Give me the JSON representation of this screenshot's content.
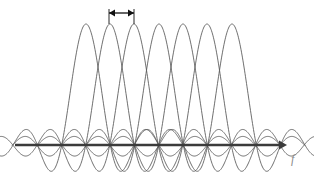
{
  "figure": {
    "title": "",
    "axis_label_f": "f",
    "axis_label_x": 291,
    "axis_label_y": 152,
    "axis_label_size": 12,
    "background": "#ffffff",
    "curve_color": "#555555",
    "axis_color": "#3b3b3b",
    "annotation_color": "#111111"
  },
  "chart_data": {
    "type": "line",
    "xlabel": "f",
    "ylabel": "",
    "grid": false,
    "legend": null,
    "axis": {
      "baseline_y_px": 145,
      "x_start_px": 15,
      "x_end_px": 286,
      "arrowhead": "right",
      "line_width_px": 2.4
    },
    "subcarriers": {
      "count": 7,
      "peak_positions_px": [
        86,
        110,
        134,
        159,
        183,
        207,
        232
      ],
      "peak_spacing_px": 24.3,
      "peak_top_y_px": 24,
      "main_lobe_half_width_px": 24.3,
      "amplitude_px": 121,
      "sidelobe_count_each_side": 5,
      "sidelobe_max_px": 20,
      "sinc_cutoff_px": 122
    },
    "annotation": {
      "kind": "double-headed-arrow",
      "label": "",
      "x_left_px": 109,
      "x_right_px": 134,
      "y_px": 13,
      "tick_drop_px": 11,
      "meaning": "subcarrier spacing"
    },
    "series": [
      {
        "name": "subcarrier-1",
        "peak_x": 86,
        "peak_y": 1.0,
        "nulls_at": [
          61.7,
          110.3,
          134.6,
          158.9,
          183.2,
          207.5
        ]
      },
      {
        "name": "subcarrier-2",
        "peak_x": 110,
        "peak_y": 1.0,
        "nulls_at": [
          85.7,
          134.3,
          158.6,
          182.9,
          207.2,
          231.5
        ]
      },
      {
        "name": "subcarrier-3",
        "peak_x": 134,
        "peak_y": 1.0,
        "nulls_at": [
          109.7,
          158.3,
          182.6,
          206.9,
          231.2,
          255.5
        ]
      },
      {
        "name": "subcarrier-4",
        "peak_x": 159,
        "peak_y": 1.0,
        "nulls_at": [
          134.7,
          183.3,
          207.6,
          231.9,
          256.2,
          280.5
        ]
      },
      {
        "name": "subcarrier-5",
        "peak_x": 183,
        "peak_y": 1.0,
        "nulls_at": [
          158.7,
          207.3,
          231.6,
          255.9,
          280.2
        ]
      },
      {
        "name": "subcarrier-6",
        "peak_x": 207,
        "peak_y": 1.0,
        "nulls_at": [
          182.7,
          231.3,
          255.6,
          279.9
        ]
      },
      {
        "name": "subcarrier-7",
        "peak_x": 232,
        "peak_y": 1.0,
        "nulls_at": [
          207.7,
          256.3,
          280.6
        ]
      }
    ]
  }
}
